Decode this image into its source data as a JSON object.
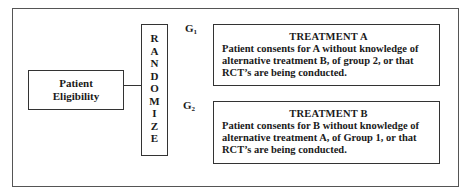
{
  "diagram": {
    "eligibility": {
      "lines": [
        "Patient",
        "Eligibility"
      ]
    },
    "randomize": {
      "letters": [
        "R",
        "A",
        "N",
        "D",
        "O",
        "M",
        "I",
        "Z",
        "E"
      ]
    },
    "groups": [
      {
        "label": "G",
        "subscript": "1"
      },
      {
        "label": "G",
        "subscript": "2"
      }
    ],
    "treatments": [
      {
        "title": "TREATMENT A",
        "lines": [
          "Patient consents for A without knowledge of",
          "alternative treatment B, of group 2, or that",
          "RCT’s are being conducted."
        ]
      },
      {
        "title": "TREATMENT B",
        "lines": [
          "Patient consents for B without knowledge of",
          "alternative treatment A, of Group 1, or that",
          "RCT’s are being conducted."
        ]
      }
    ]
  }
}
